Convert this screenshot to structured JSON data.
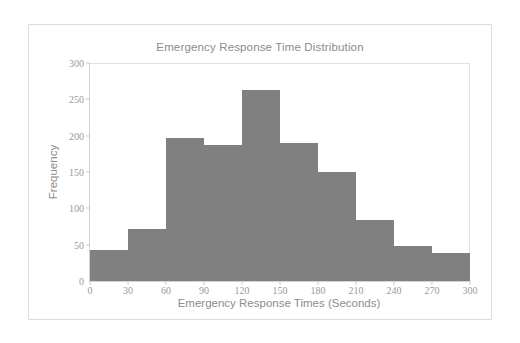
{
  "figure": {
    "background": "#ffffff",
    "border_color": "#dcdcdc",
    "bar_color": "#808080",
    "axis_color": "#d3d3d3",
    "text_color": "#8c8c8c"
  },
  "chart_data": {
    "type": "bar",
    "title": "Emergency Response Time Distribution",
    "xlabel": "Emergency Response Times (Seconds)",
    "ylabel": "Frequency",
    "grid": false,
    "legend": null,
    "xlim": [
      0,
      300
    ],
    "ylim": [
      0,
      300
    ],
    "bin_width": 30,
    "bin_edges": [
      0,
      30,
      60,
      90,
      120,
      150,
      180,
      210,
      240,
      270,
      300
    ],
    "categories": [
      "0-30",
      "30-60",
      "60-90",
      "90-120",
      "120-150",
      "150-180",
      "180-210",
      "210-240",
      "240-270",
      "270-300"
    ],
    "values": [
      43,
      72,
      197,
      187,
      263,
      190,
      150,
      84,
      48,
      38
    ],
    "xticks": [
      0,
      30,
      60,
      90,
      120,
      150,
      180,
      210,
      240,
      270,
      300
    ],
    "xtick_labels": [
      "0",
      "30",
      "60",
      "90",
      "120",
      "150",
      "180",
      "210",
      "240",
      "270",
      "300"
    ],
    "yticks": [
      0,
      50,
      100,
      150,
      200,
      250,
      300
    ],
    "ytick_labels": [
      "0",
      "50",
      "100",
      "150",
      "200",
      "250",
      "300"
    ]
  }
}
